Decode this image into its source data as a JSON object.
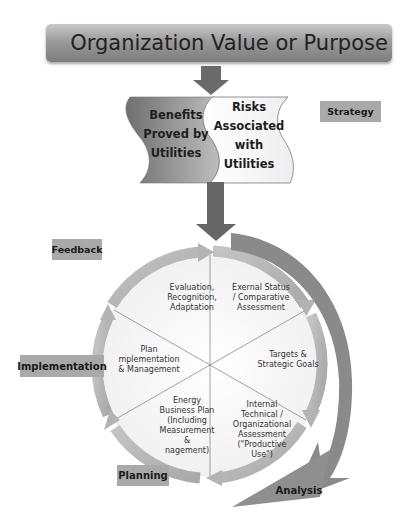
{
  "header": {
    "title": "Organization Value or Purpose"
  },
  "wave_banners": {
    "left": {
      "lines": [
        "Benefits",
        "Proved by",
        "Utilities"
      ]
    },
    "right": {
      "lines": [
        "Risks",
        "Associated",
        "with",
        "Utilities"
      ]
    }
  },
  "phase_labels": {
    "strategy": "Strategy",
    "feedback": "Feedback",
    "implementation": "Implementation",
    "planning": "Planning",
    "analysis": "Analysis"
  },
  "cycle_segments": [
    {
      "id": "evaluation",
      "lines": [
        "Evaluation,",
        "Recognition,",
        "Adaptation"
      ]
    },
    {
      "id": "external-status",
      "lines": [
        "Exernal Status",
        "/ Comparative",
        "Assessment"
      ]
    },
    {
      "id": "targets",
      "lines": [
        "Targets &",
        "Strategic Goals"
      ]
    },
    {
      "id": "internal-assessment",
      "lines": [
        "Internal",
        "Technical /",
        "Organizational",
        "Assessment",
        "(\"Productive",
        "Use\")"
      ]
    },
    {
      "id": "energy-plan",
      "lines": [
        "Energy",
        "Business Plan",
        "(Including",
        "Measurement",
        "&",
        "nagement)"
      ]
    },
    {
      "id": "plan-implementation",
      "lines": [
        "Plan",
        "mplementation",
        "& Management"
      ]
    }
  ],
  "colors": {
    "banner_dark": "#7c7c7c",
    "banner_light": "#c9c9c9",
    "arrow": "#6a6a6a",
    "tag_bg": "#a9a9a9",
    "cycle_arrow": "#bdbdbd",
    "outer_arrow": "#8a8a8a"
  }
}
